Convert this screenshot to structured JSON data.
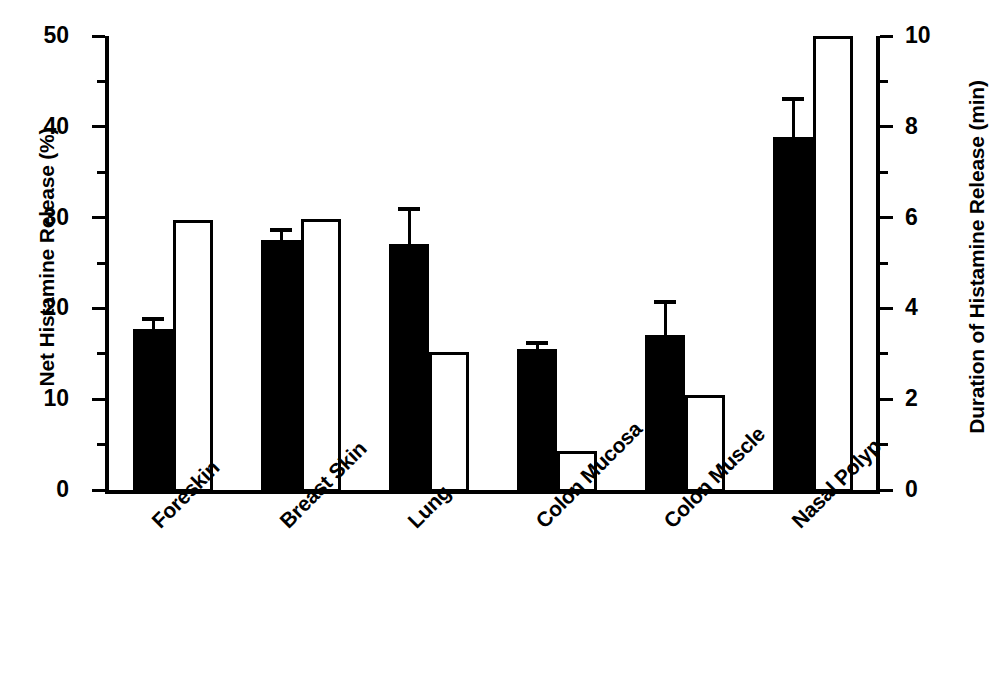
{
  "chart_data": {
    "type": "bar",
    "title": "",
    "categories": [
      "Foreskin",
      "Breast Skin",
      "Lung",
      "Colon Mucosa",
      "Colon Muscle",
      "Nasal Polyp"
    ],
    "series": [
      {
        "name": "Net Histamine Release (%)",
        "style": "filled-black",
        "axis": "left",
        "values": [
          17.7,
          27.5,
          27.1,
          15.5,
          17.1,
          38.9
        ],
        "errors": [
          1.3,
          1.4,
          4.1,
          0.9,
          3.8,
          4.4
        ]
      },
      {
        "name": "Duration of Histamine Release (min)",
        "style": "open-white",
        "axis": "right",
        "values": [
          5.95,
          5.98,
          3.05,
          0.85,
          2.1,
          10.0
        ],
        "errors": [
          0,
          0,
          0,
          0,
          0,
          0
        ]
      }
    ],
    "ylabel": "Net Histamine Release (%)",
    "y2label": "Duration of Histamine Release (min)",
    "xlabel": "",
    "ylim": [
      0,
      50
    ],
    "y2lim": [
      0,
      10
    ],
    "yticks": [
      0,
      10,
      20,
      30,
      40,
      50
    ],
    "yticks_minor": [
      5,
      15,
      25,
      35,
      45
    ],
    "y2ticks": [
      0,
      2,
      4,
      6,
      8,
      10
    ],
    "y2ticks_minor": [
      1,
      3,
      5,
      7,
      9
    ],
    "ytick_labels": [
      "0",
      "10",
      "20",
      "30",
      "40",
      "50"
    ],
    "y2tick_labels": [
      "0",
      "2",
      "4",
      "6",
      "8",
      "10"
    ],
    "grid": false,
    "legend": "none",
    "colors": {
      "filled": "#000000",
      "open": "#ffffff",
      "outline": "#000000",
      "background": "#ffffff"
    }
  }
}
